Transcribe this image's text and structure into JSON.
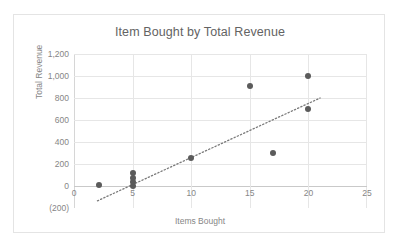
{
  "chart_data": {
    "type": "scatter",
    "title": "Item Bought by Total Revenue",
    "xlabel": "Items Bought",
    "ylabel": "Total Revenue",
    "xlim": [
      0,
      25
    ],
    "ylim": [
      -200,
      1200
    ],
    "xticks": [
      0,
      5,
      10,
      15,
      20,
      25
    ],
    "xtick_labels": [
      "0",
      "5",
      "10",
      "15",
      "20",
      "25"
    ],
    "yticks": [
      -200,
      0,
      200,
      400,
      600,
      800,
      1000,
      1200
    ],
    "ytick_labels": [
      "(200)",
      "0",
      "200",
      "400",
      "600",
      "800",
      "1,000",
      "1,200"
    ],
    "grid": true,
    "legend": false,
    "marker_color": "#5b5b5b",
    "gridline_color": "#e6e6e6",
    "title_color": "#636363",
    "tick_color": "#868686",
    "points": [
      {
        "x": 2.1,
        "y": 10
      },
      {
        "x": 5,
        "y": 0
      },
      {
        "x": 5,
        "y": 40
      },
      {
        "x": 5,
        "y": 75
      },
      {
        "x": 5,
        "y": 120
      },
      {
        "x": 10,
        "y": 255
      },
      {
        "x": 15,
        "y": 905
      },
      {
        "x": 17,
        "y": 300
      },
      {
        "x": 20,
        "y": 1000
      },
      {
        "x": 20,
        "y": 700
      }
    ],
    "trendline": {
      "style": "dotted",
      "color": "#7a7a7a",
      "x_start": 2.0,
      "y_start": -135,
      "x_end": 21.0,
      "y_end": 800
    }
  }
}
